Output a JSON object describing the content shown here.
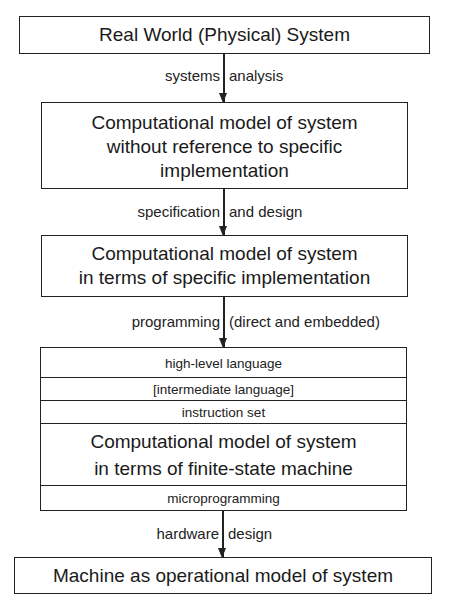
{
  "diagram": {
    "boxes": [
      {
        "id": "real-world",
        "lines": [
          "Real World (Physical) System"
        ]
      },
      {
        "id": "abstract-model",
        "lines": [
          "Computational model of system",
          "without reference to specific",
          "implementation"
        ]
      },
      {
        "id": "implementation-model",
        "lines": [
          "Computational model of system",
          "in terms of specific implementation"
        ]
      },
      {
        "id": "fsm-model",
        "layers": [
          "high-level language",
          "[intermediate language]",
          "instruction set"
        ],
        "lines": [
          "Computational model of system",
          "in terms of finite-state machine"
        ],
        "bottom_layer": "microprogramming"
      },
      {
        "id": "machine",
        "lines": [
          "Machine as operational model of system"
        ]
      }
    ],
    "arrows": [
      {
        "from": "real-world",
        "to": "abstract-model",
        "label_left": "systems",
        "label_right": "analysis"
      },
      {
        "from": "abstract-model",
        "to": "implementation-model",
        "label_left": "specification",
        "label_right": "and design"
      },
      {
        "from": "implementation-model",
        "to": "fsm-model",
        "label_left": "programming",
        "label_right": "(direct and embedded)"
      },
      {
        "from": "fsm-model",
        "to": "machine",
        "label_left": "hardware",
        "label_right": "design"
      }
    ]
  }
}
